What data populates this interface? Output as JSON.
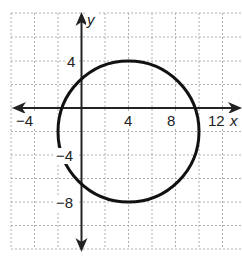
{
  "graph": {
    "x_axis_label": "x",
    "y_axis_label": "y",
    "x_ticks": [
      "−4",
      "4",
      "8",
      "12"
    ],
    "y_ticks": [
      "4",
      "−4",
      "−8"
    ],
    "grid_unit": 2,
    "x_range": [
      -6,
      14
    ],
    "y_range": [
      -14,
      8
    ]
  },
  "circle": {
    "center": [
      4,
      -2
    ],
    "radius": 6
  },
  "colors": {
    "grid": "#b0b0b0",
    "axis": "#222222",
    "curve": "#111111"
  }
}
